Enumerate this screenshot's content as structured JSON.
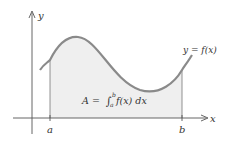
{
  "diagram": {
    "axes": {
      "x_label": "x",
      "y_label": "y"
    },
    "curve_label": "y = f(x)",
    "area_label": "A = ∫ₐᵇf(x) dx",
    "area_label_parts": {
      "A": "A = ",
      "integral": "∫",
      "lower": "a",
      "upper": "b",
      "integrand": "f(x) dx"
    },
    "ticks": {
      "a": "a",
      "b": "b"
    },
    "colors": {
      "curve": "#8a8a8a",
      "fill": "#efefef",
      "axis": "#555555"
    }
  }
}
